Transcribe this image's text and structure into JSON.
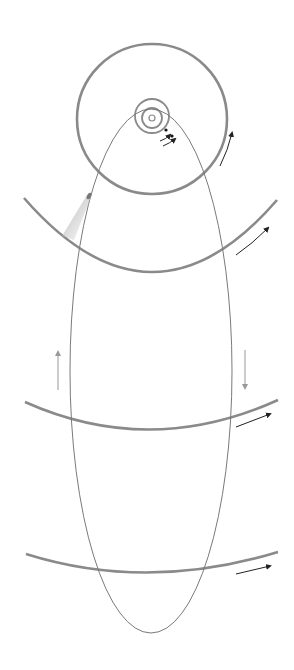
{
  "diagram": {
    "type": "comet-orbit-diagram",
    "description": "Elliptical comet orbit crossing concentric planetary orbits around the Sun",
    "colors": {
      "background": "#ffffff",
      "planet_orbit": "#8a8a8a",
      "comet_orbit": "#7a7a7a",
      "arrow": "#222222",
      "vertical_arrow": "#999999",
      "comet_tail": "#c8c8c8"
    },
    "sun": {
      "cx": 152,
      "cy": 118,
      "r": 3
    },
    "inner_orbits": [
      {
        "cx": 152,
        "cy": 118,
        "r": 10
      },
      {
        "cx": 152,
        "cy": 116,
        "r": 17
      }
    ],
    "planets": [
      {
        "cx": 166,
        "cy": 130,
        "r": 1.6
      },
      {
        "cx": 172,
        "cy": 136,
        "r": 1.6
      }
    ],
    "large_orbit": {
      "cx": 152,
      "cy": 119,
      "r": 75
    },
    "outer_arcs": [
      {
        "d": "M24,198 Q152,345 277,200"
      },
      {
        "d": "M25,402 Q150,458 278,400"
      },
      {
        "d": "M26,554 Q147,592 278,552"
      }
    ],
    "comet_orbit": {
      "cx": 151,
      "cy": 371,
      "rx": 81,
      "ry": 262
    },
    "comet": {
      "head": {
        "cx": 89,
        "cy": 196
      },
      "tail_end": {
        "x": 68,
        "y": 240
      }
    },
    "motion_arrows": [
      {
        "d": "M220,166 Q228,150 232,133",
        "label": "large-orbit-direction"
      },
      {
        "d": "M236,255 Q252,244 268,228",
        "label": "arc1-direction"
      },
      {
        "d": "M236,427 L270,414",
        "label": "arc2-direction"
      },
      {
        "d": "M236,574 L270,566",
        "label": "arc3-direction"
      },
      {
        "d": "M160,141 Q166,139 170,135",
        "label": "inner-orbit-direction-1"
      },
      {
        "d": "M163,146 Q170,143 175,139",
        "label": "inner-orbit-direction-2"
      }
    ],
    "comet_direction_arrows": [
      {
        "x1": 58,
        "y1": 390,
        "x2": 58,
        "y2": 352,
        "label": "comet-inbound-up"
      },
      {
        "x1": 245,
        "y1": 350,
        "x2": 245,
        "y2": 388,
        "label": "comet-outbound-down"
      }
    ]
  }
}
